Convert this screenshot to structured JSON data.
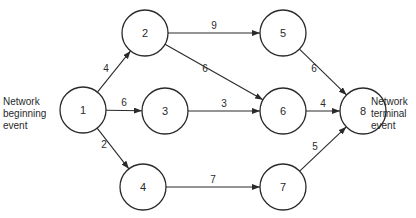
{
  "diagram": {
    "type": "network",
    "labels": {
      "start": [
        "Network",
        "beginning",
        "event"
      ],
      "end": [
        "Network",
        "terminal",
        "event"
      ]
    },
    "nodes": [
      {
        "id": "1",
        "label": "1",
        "cx": 83,
        "cy": 110
      },
      {
        "id": "2",
        "label": "2",
        "cx": 145,
        "cy": 33
      },
      {
        "id": "3",
        "label": "3",
        "cx": 165,
        "cy": 111
      },
      {
        "id": "4",
        "label": "4",
        "cx": 143,
        "cy": 187
      },
      {
        "id": "5",
        "label": "5",
        "cx": 283,
        "cy": 33
      },
      {
        "id": "6",
        "label": "6",
        "cx": 283,
        "cy": 111
      },
      {
        "id": "7",
        "label": "7",
        "cx": 283,
        "cy": 187
      },
      {
        "id": "8",
        "label": "8",
        "cx": 363,
        "cy": 111
      }
    ],
    "edges": [
      {
        "from": "1",
        "to": "2",
        "weight": "4"
      },
      {
        "from": "1",
        "to": "3",
        "weight": "6"
      },
      {
        "from": "1",
        "to": "4",
        "weight": "2"
      },
      {
        "from": "2",
        "to": "5",
        "weight": "9"
      },
      {
        "from": "2",
        "to": "6",
        "weight": "6"
      },
      {
        "from": "3",
        "to": "6",
        "weight": "3"
      },
      {
        "from": "4",
        "to": "7",
        "weight": "7"
      },
      {
        "from": "5",
        "to": "8",
        "weight": "6"
      },
      {
        "from": "6",
        "to": "8",
        "weight": "4"
      },
      {
        "from": "7",
        "to": "8",
        "weight": "5"
      }
    ],
    "node_radius": 23
  }
}
